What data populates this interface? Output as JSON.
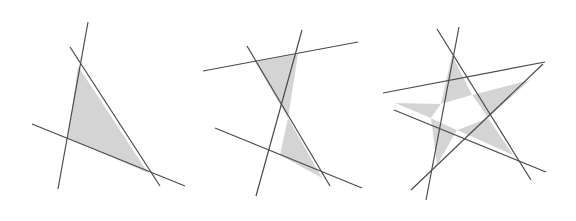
{
  "figure": {
    "width": 576,
    "height": 221,
    "background_color": "#ffffff",
    "fill_color": "#d4d4d4",
    "line_color": "#4a4a4a",
    "line_width": 1.2,
    "panel_count": 3
  },
  "chart_data": {
    "type": "diagram",
    "xlabel": "",
    "ylabel": "",
    "xlim": [
      0,
      576
    ],
    "ylim": [
      0,
      221
    ],
    "grid": false,
    "legend": "none",
    "panels": [
      {
        "name": "panel-triangle",
        "label": "3 lines — one bounded triangular region",
        "line_count": 3,
        "filled_region_count": 1,
        "lines": [
          {
            "name": "line-a",
            "x1": 88,
            "y1": 22,
            "x2": 58,
            "y2": 189
          },
          {
            "name": "line-b",
            "x1": 70,
            "y1": 47,
            "x2": 160,
            "y2": 186
          },
          {
            "name": "line-c",
            "x1": 32,
            "y1": 124,
            "x2": 185,
            "y2": 186
          }
        ],
        "regions": [
          {
            "name": "triangle-region",
            "fill": "#d4d4d4",
            "points": [
              [
                78,
                66
              ],
              [
                68,
                138
              ],
              [
                148,
                173
              ]
            ]
          }
        ]
      },
      {
        "name": "panel-bowtie",
        "label": "4 lines — two bounded triangular regions meeting at a crossing",
        "line_count": 4,
        "filled_region_count": 2,
        "lines": [
          {
            "name": "line-a",
            "x1": 247,
            "y1": 46,
            "x2": 330,
            "y2": 186
          },
          {
            "name": "line-b",
            "x1": 302,
            "y1": 30,
            "x2": 256,
            "y2": 196
          },
          {
            "name": "line-c",
            "x1": 203,
            "y1": 71,
            "x2": 358,
            "y2": 42
          },
          {
            "name": "line-d",
            "x1": 215,
            "y1": 128,
            "x2": 362,
            "y2": 188
          }
        ],
        "regions": [
          {
            "name": "upper-triangle-region",
            "fill": "#d4d4d4",
            "points": [
              [
                255,
                62
              ],
              [
                298,
                54
              ],
              [
                288,
                118
              ]
            ]
          },
          {
            "name": "lower-triangle-region",
            "fill": "#d4d4d4",
            "points": [
              [
                288,
                118
              ],
              [
                280,
                155
              ],
              [
                322,
                178
              ]
            ]
          }
        ]
      },
      {
        "name": "panel-pentagram",
        "label": "5 lines — five shaded star points around an unfilled central pentagon",
        "line_count": 5,
        "filled_region_count": 5,
        "lines": [
          {
            "name": "line-a",
            "x1": 459,
            "y1": 27,
            "x2": 426,
            "y2": 200
          },
          {
            "name": "line-b",
            "x1": 437,
            "y1": 29,
            "x2": 531,
            "y2": 180
          },
          {
            "name": "line-c",
            "x1": 383,
            "y1": 93,
            "x2": 545,
            "y2": 62
          },
          {
            "name": "line-d",
            "x1": 394,
            "y1": 110,
            "x2": 546,
            "y2": 172
          },
          {
            "name": "line-e",
            "x1": 411,
            "y1": 190,
            "x2": 543,
            "y2": 64
          }
        ],
        "regions": [
          {
            "name": "star-point-top",
            "fill": "#d4d4d4",
            "points": [
              [
                452,
                55
              ],
              [
                441,
                104
              ],
              [
                472,
                95
              ]
            ]
          },
          {
            "name": "star-point-right",
            "fill": "#d4d4d4",
            "points": [
              [
                530,
                80
              ],
              [
                472,
                95
              ],
              [
                488,
                118
              ]
            ]
          },
          {
            "name": "star-point-bottom-right",
            "fill": "#d4d4d4",
            "points": [
              [
                513,
                155
              ],
              [
                488,
                118
              ],
              [
                457,
                130
              ]
            ]
          },
          {
            "name": "star-point-bottom-left",
            "fill": "#d4d4d4",
            "points": [
              [
                437,
                165
              ],
              [
                457,
                130
              ],
              [
                431,
                118
              ]
            ]
          },
          {
            "name": "star-point-left",
            "fill": "#d4d4d4",
            "points": [
              [
                395,
                103
              ],
              [
                431,
                118
              ],
              [
                441,
                104
              ]
            ]
          }
        ],
        "central_region": {
          "name": "central-pentagon",
          "fill": "#ffffff",
          "points": [
            [
              441,
              104
            ],
            [
              472,
              95
            ],
            [
              488,
              118
            ],
            [
              457,
              130
            ],
            [
              431,
              118
            ]
          ]
        }
      }
    ]
  }
}
